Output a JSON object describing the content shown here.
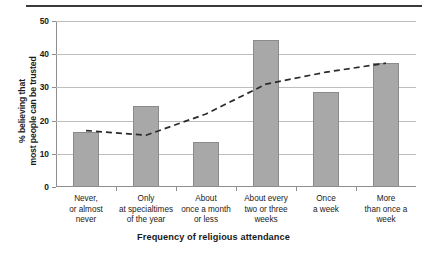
{
  "chart_data": {
    "type": "bar",
    "title": "",
    "subtitle": "",
    "xlabel": "Frequency of religious attendance",
    "ylabel": "% believing that most people can be trusted",
    "ylabel_lines": [
      "% believing that",
      "most people can be trusted"
    ],
    "categories": [
      "Never,\nor almost\nnever",
      "Only\nat specialtimes\nof the year",
      "About\nonce a month\nor less",
      "About every\ntwo or three\nweeks",
      "Once\na week",
      "More\nthan once a\nweek"
    ],
    "category_lines": [
      [
        "Never,",
        "or almost",
        "never"
      ],
      [
        "Only",
        "at specialtimes",
        "of the year"
      ],
      [
        "About",
        "once a month",
        "or less"
      ],
      [
        "About every",
        "two or three",
        "weeks"
      ],
      [
        "Once",
        "a week"
      ],
      [
        "More",
        "than once a",
        "week"
      ]
    ],
    "values": [
      16.6,
      24.3,
      13.5,
      44.2,
      28.5,
      37.5
    ],
    "series": [
      {
        "name": "% believing most people can be trusted",
        "style": "bar",
        "values": [
          16.6,
          24.3,
          13.5,
          44.2,
          28.5,
          37.5
        ]
      },
      {
        "name": "trend",
        "style": "dashed-line",
        "values": [
          17.0,
          15.6,
          22.0,
          31.0,
          34.6,
          37.3
        ]
      }
    ],
    "ylim": [
      0,
      50
    ],
    "yticks": [
      0,
      10,
      20,
      30,
      40,
      50
    ],
    "ytick_labels": [
      "0",
      "10",
      "20",
      "30",
      "40",
      "50"
    ],
    "grid": true,
    "grid_axis": "y",
    "legend": false,
    "legend_position": "none",
    "colors": {
      "bar_fill": "#a8a8a8",
      "bar_border": "#8b8b8b",
      "gridline": "#bdbdbd",
      "axis": "#8e8e8e",
      "trend_line": "#2b2b2b",
      "text": "#1a1a1a",
      "top_rule": "#3c3a38",
      "background": "#ffffff"
    }
  }
}
